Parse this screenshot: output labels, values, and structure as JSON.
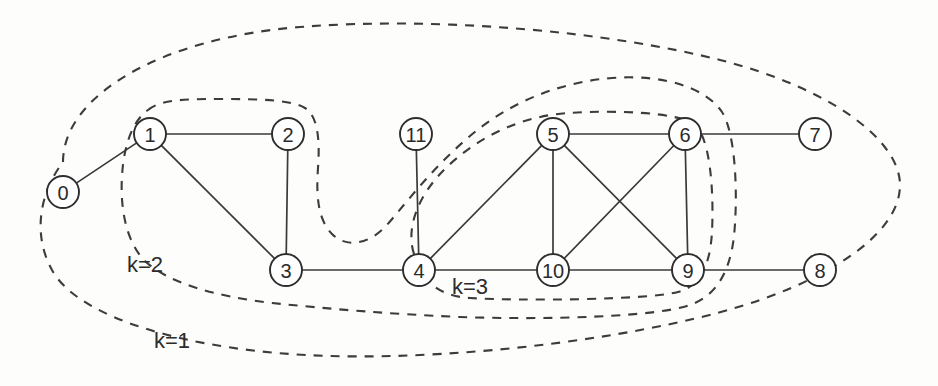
{
  "figure": {
    "background_color": "#fdfdfc",
    "node_fill": "#ffffff",
    "node_stroke": "#2e2e2e",
    "edge_color": "#3a3a3a",
    "shell_color": "#3c3c3c"
  },
  "chart_data": {
    "type": "diagram",
    "subtype": "node-link-graph",
    "node_count": 12,
    "edge_count": 17,
    "nodes": [
      {
        "id": "0",
        "label": "0",
        "x": 63,
        "y": 192,
        "r": 16,
        "core": 1
      },
      {
        "id": "1",
        "label": "1",
        "x": 150,
        "y": 134,
        "r": 16,
        "core": 2
      },
      {
        "id": "2",
        "label": "2",
        "x": 288,
        "y": 134,
        "r": 16,
        "core": 2
      },
      {
        "id": "3",
        "label": "3",
        "x": 286,
        "y": 270,
        "r": 16,
        "core": 2
      },
      {
        "id": "4",
        "label": "4",
        "x": 419,
        "y": 270,
        "r": 16,
        "core": 2
      },
      {
        "id": "5",
        "label": "5",
        "x": 553,
        "y": 134,
        "r": 16,
        "core": 3
      },
      {
        "id": "6",
        "label": "6",
        "x": 685,
        "y": 134,
        "r": 16,
        "core": 3
      },
      {
        "id": "7",
        "label": "7",
        "x": 815,
        "y": 134,
        "r": 16,
        "core": 1
      },
      {
        "id": "8",
        "label": "8",
        "x": 820,
        "y": 270,
        "r": 16,
        "core": 1
      },
      {
        "id": "9",
        "label": "9",
        "x": 688,
        "y": 270,
        "r": 16,
        "core": 3
      },
      {
        "id": "10",
        "label": "10",
        "x": 553,
        "y": 270,
        "r": 16,
        "core": 3
      },
      {
        "id": "11",
        "label": "11",
        "x": 416,
        "y": 134,
        "r": 16,
        "core": 1
      }
    ],
    "edges": [
      {
        "source": "0",
        "target": "1"
      },
      {
        "source": "1",
        "target": "2"
      },
      {
        "source": "1",
        "target": "3"
      },
      {
        "source": "2",
        "target": "3"
      },
      {
        "source": "3",
        "target": "4"
      },
      {
        "source": "4",
        "target": "11"
      },
      {
        "source": "4",
        "target": "5"
      },
      {
        "source": "4",
        "target": "10"
      },
      {
        "source": "5",
        "target": "6"
      },
      {
        "source": "5",
        "target": "10"
      },
      {
        "source": "5",
        "target": "9"
      },
      {
        "source": "6",
        "target": "10"
      },
      {
        "source": "6",
        "target": "9"
      },
      {
        "source": "6",
        "target": "7"
      },
      {
        "source": "9",
        "target": "10"
      },
      {
        "source": "9",
        "target": "8"
      },
      {
        "source": "11",
        "target": "4"
      }
    ],
    "shells": [
      {
        "id": "k1",
        "label": "k=1",
        "label_x": 172,
        "label_y": 340,
        "members": [
          "0",
          "1",
          "2",
          "3",
          "4",
          "5",
          "6",
          "7",
          "8",
          "9",
          "10",
          "11"
        ]
      },
      {
        "id": "k2",
        "label": "k=2",
        "label_x": 145,
        "label_y": 264,
        "members": [
          "1",
          "2",
          "3",
          "4",
          "5",
          "6",
          "9",
          "10"
        ]
      },
      {
        "id": "k3",
        "label": "k=3",
        "label_x": 470,
        "label_y": 286,
        "members": [
          "5",
          "6",
          "9",
          "10"
        ]
      }
    ],
    "legend": null,
    "xlabel": "",
    "ylabel": "",
    "grid": false
  }
}
